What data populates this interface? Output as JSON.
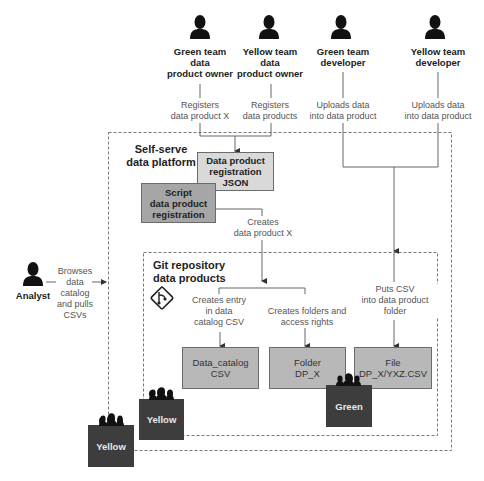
{
  "actors": [
    {
      "id": "green-owner",
      "label_lines": [
        "Green team",
        "data",
        "product owner"
      ],
      "action_lines": [
        "Registers",
        "data product X"
      ]
    },
    {
      "id": "yellow-owner",
      "label_lines": [
        "Yellow team",
        "data",
        "product owner"
      ],
      "action_lines": [
        "Registers",
        "data products"
      ]
    },
    {
      "id": "green-dev",
      "label_lines": [
        "Green team",
        "developer"
      ],
      "action_lines": [
        "Uploads data",
        "into data product"
      ]
    },
    {
      "id": "yellow-dev",
      "label_lines": [
        "Yellow team",
        "developer"
      ],
      "action_lines": [
        "Uploads data",
        "into data product"
      ]
    },
    {
      "id": "analyst",
      "label_lines": [
        "Analyst"
      ],
      "action_lines": [
        "Browses",
        "data",
        "catalog",
        "and pulls",
        "CSVs"
      ]
    }
  ],
  "platform": {
    "title_lines": [
      "Self-serve",
      "data platform"
    ],
    "registration_json": [
      "Data product",
      "registration",
      "JSON"
    ],
    "script": [
      "Script",
      "data product",
      "registration"
    ],
    "creates_note": [
      "Creates",
      "data product X"
    ]
  },
  "git_repo": {
    "title_lines": [
      "Git repository",
      "data products"
    ],
    "icon": "git-icon",
    "notes": {
      "catalog_entry": [
        "Creates entry",
        "in data",
        "catalog CSV"
      ],
      "folders": [
        "Creates folders and",
        "access rights"
      ],
      "puts_csv": [
        "Puts CSV",
        "into data product",
        "folder"
      ]
    },
    "artifacts": {
      "data_catalog": [
        "Data_catalog",
        "CSV"
      ],
      "folder": [
        "Folder",
        "DP_X"
      ],
      "file": [
        "File",
        "DP_X/YXZ.CSV"
      ]
    }
  },
  "teams": {
    "green": "Green",
    "yellow_inner": "Yellow",
    "yellow_outer": "Yellow"
  },
  "colors": {
    "team_box": "#3d3d3d",
    "json_box": "#d9d9d9",
    "script_box": "#a6a6a6",
    "artifact_box": "#b8b8b8",
    "line": "#666666"
  }
}
